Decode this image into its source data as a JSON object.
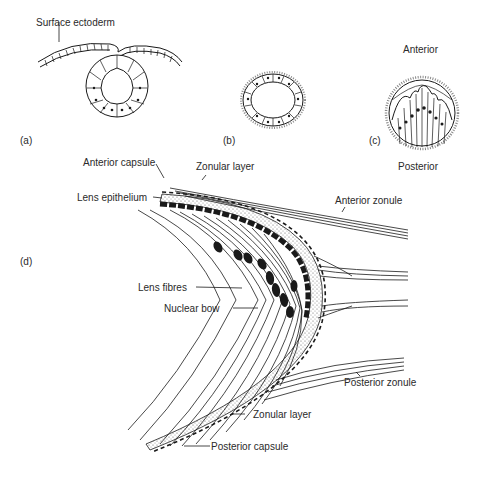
{
  "figure": {
    "panels": {
      "a": "(a)",
      "b": "(b)",
      "c": "(c)",
      "d": "(d)"
    },
    "labels": {
      "surface_ectoderm": "Surface ectoderm",
      "anterior": "Anterior",
      "posterior": "Posterior",
      "anterior_capsule": "Anterior capsule",
      "zonular_layer_top": "Zonular layer",
      "lens_epithelium": "Lens epithelium",
      "anterior_zonule": "Anterior zonule",
      "lens_fibres": "Lens fibres",
      "nuclear_bow": "Nuclear bow",
      "posterior_zonule": "Posterior zonule",
      "zonular_layer_bottom": "Zonular layer",
      "posterior_capsule": "Posterior capsule"
    },
    "colors": {
      "ink": "#1a1a1a",
      "stipple": "#cfcfcf",
      "background": "#ffffff"
    }
  }
}
